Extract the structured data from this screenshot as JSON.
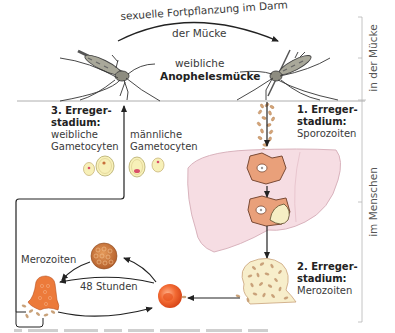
{
  "diagram": {
    "title_top": {
      "arc_line1": "sexuelle Fortpflanzung im Darm",
      "arc_line2": "der Mücke",
      "center_line1": "weibliche",
      "center_line2": "Anophelesmücke"
    },
    "stages": [
      {
        "number_label": "1. Erreger-",
        "line2": "stadium:",
        "name": "Sporozoiten"
      },
      {
        "number_label": "2. Erreger-",
        "line2": "stadium:",
        "name": "Merozoiten"
      },
      {
        "number_label": "3. Erreger-",
        "line2": "stadium:",
        "name_line1": "weibliche",
        "name_line2": "Gametocyten"
      }
    ],
    "male_gametocytes": {
      "line1": "männliche",
      "line2": "Gametocyten"
    },
    "cycle": {
      "merozoites_label": "Merozoiten",
      "duration_label": "48 Stunden"
    },
    "side_labels": {
      "mosquito": "in der Mücke",
      "human": "im Menschen"
    },
    "icons": [
      "mosquito-left-icon",
      "mosquito-right-icon",
      "sporozoite-cluster-icon",
      "liver-icon",
      "liver-cell-icon",
      "schizont-icon",
      "red-blood-cell-icon",
      "ruptured-cell-icon",
      "gametocyte-icon"
    ],
    "colors": {
      "liver": "#f6dde3",
      "liver_stroke": "#d9b3bd",
      "cell": "#e9a07a",
      "rbc": "#f0602a",
      "parasite": "#c9a27a",
      "gametocyte_fill": "#f7f0b8",
      "line": "#222222",
      "ruler": "#b5b5b5"
    }
  }
}
